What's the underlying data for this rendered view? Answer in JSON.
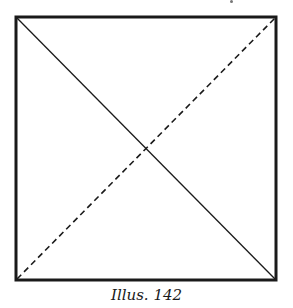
{
  "figure": {
    "shape": "square",
    "diagonals": [
      {
        "from": "top-left",
        "to": "bottom-right",
        "style": "solid"
      },
      {
        "from": "bottom-left",
        "to": "top-right",
        "style": "dashed"
      }
    ],
    "stroke_color": "#1a1a1a"
  },
  "caption": "Illus. 142"
}
